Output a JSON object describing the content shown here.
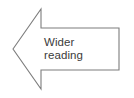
{
  "canvas": {
    "width": 134,
    "height": 98,
    "background_color": "#ffffff"
  },
  "shape": {
    "name": "left-pointing-block-arrow",
    "type": "polygon",
    "direction": "left",
    "fill_color": "#ffffff",
    "stroke_color": "#7d7d7d",
    "stroke_width": 1.1,
    "points": "13,49 41,9 41,28 119,28 119,70 41,70 41,89",
    "vertices": [
      {
        "name": "arrow-tip",
        "x": 13,
        "y": 49
      },
      {
        "name": "head-top-outer",
        "x": 41,
        "y": 9
      },
      {
        "name": "head-top-inner",
        "x": 41,
        "y": 28
      },
      {
        "name": "body-top-right",
        "x": 119,
        "y": 28
      },
      {
        "name": "body-bottom-right",
        "x": 119,
        "y": 70
      },
      {
        "name": "head-bottom-inner",
        "x": 41,
        "y": 70
      },
      {
        "name": "head-bottom-outer",
        "x": 41,
        "y": 89
      }
    ]
  },
  "label": {
    "text": "Wider reading",
    "lines": [
      "Wider",
      "reading"
    ],
    "color": "#3b3b3b",
    "font_size_px": 11.5,
    "align": "left"
  }
}
